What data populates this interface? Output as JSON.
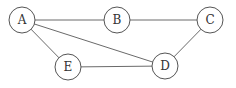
{
  "graph": {
    "nodes": [
      {
        "id": "A",
        "label": "A",
        "x": 22,
        "y": 20
      },
      {
        "id": "B",
        "label": "B",
        "x": 117,
        "y": 20
      },
      {
        "id": "C",
        "label": "C",
        "x": 210,
        "y": 20
      },
      {
        "id": "D",
        "label": "D",
        "x": 165,
        "y": 66
      },
      {
        "id": "E",
        "label": "E",
        "x": 68,
        "y": 67
      }
    ],
    "edges": [
      {
        "from": "A",
        "to": "B"
      },
      {
        "from": "B",
        "to": "C"
      },
      {
        "from": "A",
        "to": "D"
      },
      {
        "from": "A",
        "to": "E"
      },
      {
        "from": "E",
        "to": "D"
      },
      {
        "from": "C",
        "to": "D"
      }
    ],
    "node_radius": 13,
    "colors": {
      "stroke": "#555555",
      "edge": "#6a6a6a",
      "fill": "#ffffff",
      "text": "#333333"
    }
  }
}
